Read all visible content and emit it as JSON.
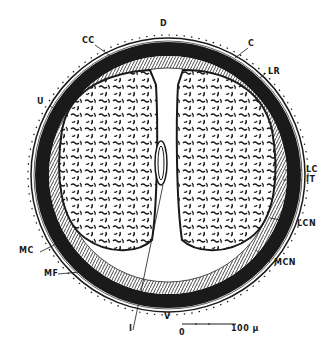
{
  "diagram": {
    "type": "cross-section",
    "colors": {
      "ink": "#1a1a1a",
      "paper": "#ffffff"
    },
    "labels": {
      "D": "D",
      "CC": "CC",
      "C": "C",
      "LR": "LR",
      "U": "U",
      "LC": "LC",
      "IT": "IT",
      "LCN": "LCN",
      "MCN": "MCN",
      "MC": "MC",
      "MF": "MF",
      "I": "I",
      "V": "V"
    },
    "scale_bar": {
      "start": "0",
      "end": "100 µ"
    }
  }
}
